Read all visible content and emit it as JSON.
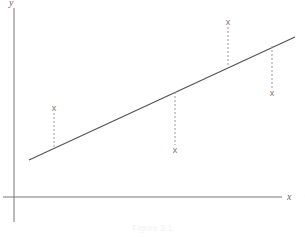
{
  "diagram": {
    "axes": {
      "x_label": "x",
      "y_label": "y"
    },
    "regression_line": {
      "x1": 29,
      "y1": 160,
      "x2": 295,
      "y2": 37,
      "color": "#555555"
    },
    "points": [
      {
        "label": "x",
        "px": 54,
        "py": 108,
        "line_y": 148
      },
      {
        "label": "x",
        "px": 175,
        "py": 150,
        "line_y": 92
      },
      {
        "label": "x",
        "px": 228,
        "py": 22,
        "line_y": 67
      },
      {
        "label": "x",
        "px": 272,
        "py": 93,
        "line_y": 46
      }
    ],
    "caption": "Figure 3.1"
  }
}
